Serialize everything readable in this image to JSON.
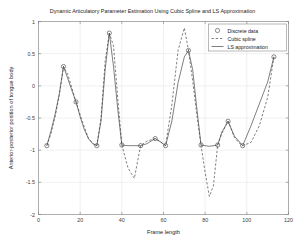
{
  "chart_data": {
    "type": "line",
    "title": "Dynamic Articulatory Parameter Estimation Using Cubic Spline and LS Approximation",
    "xlabel": "Frame length",
    "ylabel": "Anterior-posterior position of tongue body",
    "xlim": [
      0,
      120
    ],
    "ylim": [
      -2,
      1
    ],
    "xticks": [
      0,
      20,
      40,
      60,
      80,
      100,
      120
    ],
    "xtick_labels": [
      "0",
      "20",
      "40",
      "60",
      "80",
      "100",
      "120"
    ],
    "yticks": [
      1,
      0.5,
      0,
      -0.5,
      -1,
      -1.5,
      -2
    ],
    "ytick_labels": [
      "1",
      "0.5",
      "0",
      "-0.5",
      "-1",
      "-1.5",
      "-2"
    ],
    "grid": true,
    "legend_position": "top-right",
    "legend": [
      {
        "label": "Discrete data",
        "style": "marker-circle"
      },
      {
        "label": "Cubic spline",
        "style": "dashed-line"
      },
      {
        "label": "LS approximation",
        "style": "solid-line"
      }
    ],
    "series": [
      {
        "name": "Discrete data",
        "style": "marker-circle",
        "points": [
          [
            4,
            -0.93
          ],
          [
            12,
            0.3
          ],
          [
            18,
            -0.25
          ],
          [
            28,
            -0.93
          ],
          [
            34,
            0.82
          ],
          [
            40,
            -0.92
          ],
          [
            49,
            -0.93
          ],
          [
            56,
            -0.82
          ],
          [
            61,
            -0.93
          ],
          [
            72,
            0.55
          ],
          [
            78,
            -0.92
          ],
          [
            86,
            -0.92
          ],
          [
            91,
            -0.55
          ],
          [
            98,
            -0.93
          ],
          [
            113,
            0.45
          ]
        ]
      },
      {
        "name": "LS approximation",
        "style": "solid-line",
        "x": [
          4,
          6,
          8,
          10,
          12,
          14,
          16,
          18,
          20,
          22,
          24,
          26,
          28,
          30,
          32,
          34,
          36,
          38,
          40,
          43,
          46,
          49,
          52,
          56,
          59,
          61,
          64,
          67,
          70,
          72,
          74,
          76,
          78,
          82,
          86,
          88,
          91,
          94,
          98,
          102,
          106,
          110,
          113
        ],
        "y": [
          -0.93,
          -0.7,
          -0.44,
          -0.12,
          0.3,
          0.12,
          -0.07,
          -0.25,
          -0.48,
          -0.68,
          -0.82,
          -0.9,
          -0.93,
          -0.55,
          0.25,
          0.82,
          0.3,
          -0.35,
          -0.92,
          -0.93,
          -0.93,
          -0.93,
          -0.9,
          -0.82,
          -0.88,
          -0.93,
          -0.55,
          0.05,
          0.45,
          0.55,
          0.25,
          -0.35,
          -0.92,
          -0.94,
          -0.92,
          -0.72,
          -0.55,
          -0.78,
          -0.93,
          -0.62,
          -0.28,
          0.06,
          0.45
        ]
      },
      {
        "name": "Cubic spline",
        "style": "dashed-line",
        "x": [
          4,
          6,
          8,
          10,
          12,
          14,
          16,
          18,
          21,
          24,
          27,
          28,
          30,
          32,
          34,
          36,
          38,
          40,
          43,
          46,
          49,
          52,
          54,
          56,
          58,
          61,
          64,
          67,
          70,
          72,
          74,
          76,
          78,
          80,
          82,
          84,
          86,
          88,
          91,
          94,
          96,
          98,
          102,
          106,
          110,
          113
        ],
        "y": [
          -0.93,
          -0.74,
          -0.48,
          -0.14,
          0.3,
          0.18,
          -0.03,
          -0.25,
          -0.55,
          -0.82,
          -0.92,
          -0.93,
          -0.5,
          0.38,
          0.82,
          0.62,
          -0.18,
          -0.92,
          -1.28,
          -1.44,
          -0.93,
          -0.86,
          -0.84,
          -0.82,
          -0.86,
          -0.93,
          -0.3,
          0.55,
          0.9,
          0.55,
          0.08,
          -0.45,
          -0.92,
          -1.35,
          -1.72,
          -1.55,
          -0.92,
          -0.74,
          -0.55,
          -0.8,
          -0.88,
          -0.93,
          -0.88,
          -0.62,
          -0.18,
          0.45
        ]
      }
    ]
  }
}
